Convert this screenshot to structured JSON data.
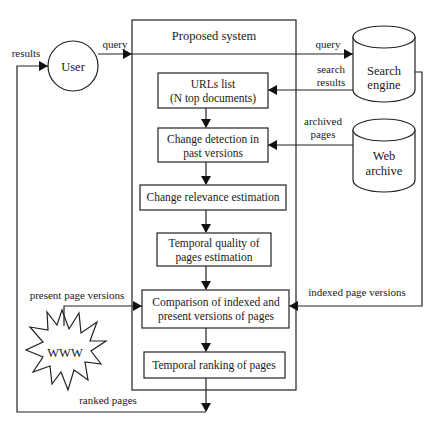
{
  "diagram": {
    "container": {
      "title": "Proposed system"
    },
    "actors": {
      "user": "User",
      "search_engine": [
        "Search",
        "engine"
      ],
      "web_archive": [
        "Web",
        "archive"
      ],
      "www": "WWW"
    },
    "steps": [
      {
        "lines": [
          "URLs list",
          "(N top documents)"
        ]
      },
      {
        "lines": [
          "Change detection in",
          "past versions"
        ]
      },
      {
        "lines": [
          "Change relevance estimation"
        ]
      },
      {
        "lines": [
          "Temporal quality of",
          "pages estimation"
        ]
      },
      {
        "lines": [
          "Comparison of indexed and",
          "present versions of pages"
        ]
      },
      {
        "lines": [
          "Temporal ranking of pages"
        ]
      }
    ],
    "edge_labels": {
      "results": "results",
      "query_user": "query",
      "query_engine": "query",
      "search_results": [
        "search",
        "results"
      ],
      "archived_pages": [
        "archived",
        "pages"
      ],
      "indexed_page_versions": "indexed page versions",
      "present_page_versions": "present page versions",
      "ranked_pages": "ranked pages"
    }
  }
}
